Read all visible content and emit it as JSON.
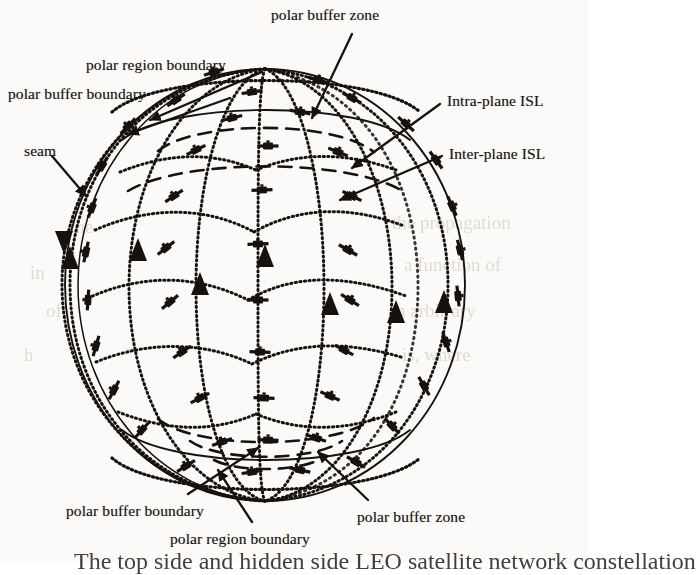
{
  "figure": {
    "kind": "diagram-line-art",
    "background_color": "#fbfaf8",
    "ink_color": "#15120f"
  },
  "labels": [
    {
      "id": "polar-buffer-zone-top",
      "text": "polar buffer zone",
      "x": 271,
      "y": 6,
      "anchor": "start"
    },
    {
      "id": "polar-region-boundary-top",
      "text": "polar region boundary",
      "x": 86,
      "y": 56,
      "anchor": "start"
    },
    {
      "id": "polar-buffer-boundary-top",
      "text": "polar buffer boundary",
      "x": 8,
      "y": 85,
      "anchor": "start"
    },
    {
      "id": "intra-plane-isl",
      "text": "Intra-plane ISL",
      "x": 447,
      "y": 92,
      "anchor": "start"
    },
    {
      "id": "inter-plane-isl",
      "text": "Inter-plane ISL",
      "x": 449,
      "y": 145,
      "anchor": "start"
    },
    {
      "id": "seam",
      "text": "seam",
      "x": 24,
      "y": 142,
      "anchor": "start"
    },
    {
      "id": "polar-buffer-boundary-bottom",
      "text": "polar buffer boundary",
      "x": 66,
      "y": 502,
      "anchor": "start"
    },
    {
      "id": "polar-buffer-zone-bottom",
      "text": "polar buffer zone",
      "x": 357,
      "y": 508,
      "anchor": "start"
    },
    {
      "id": "polar-region-boundary-bottom",
      "text": "polar region boundary",
      "x": 170,
      "y": 530,
      "anchor": "start"
    }
  ],
  "caption": {
    "text": "The top side and hidden side LEO satellite network constellation",
    "x": 74,
    "y": 548
  },
  "legend_semantics": {
    "solid_arc": "globe limb / polar buffer boundary",
    "dotted_arc": "orbital plane track (intra-plane ISL) and polar region boundary",
    "dashed_arc": "polar buffer zone boundary",
    "triangle_marker": "direction of orbital motion",
    "satellite_marker": "satellite with solar panels"
  },
  "globe": {
    "center_x": 265,
    "center_y": 285,
    "radius_x": 200,
    "radius_y": 216
  },
  "counts": {
    "orbital_planes": 7,
    "satellites_drawn": 44
  },
  "ghost_text": [
    {
      "text": "the propagation",
      "x": 392,
      "y": 212,
      "size": 19
    },
    {
      "text": "a function of",
      "x": 404,
      "y": 254,
      "size": 19
    },
    {
      "text": "n arbitrary",
      "x": 396,
      "y": 300,
      "size": 19
    },
    {
      "text": "is, where",
      "x": 402,
      "y": 344,
      "size": 19
    },
    {
      "text": "the",
      "x": 70,
      "y": 216,
      "size": 19
    },
    {
      "text": "of",
      "x": 46,
      "y": 300,
      "size": 19
    },
    {
      "text": "in",
      "x": 30,
      "y": 262,
      "size": 19
    },
    {
      "text": "h",
      "x": 24,
      "y": 344,
      "size": 19
    }
  ]
}
